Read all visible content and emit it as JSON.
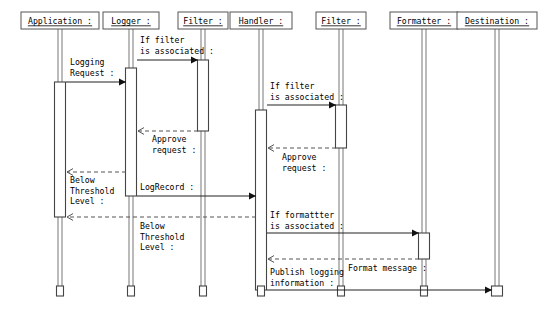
{
  "diagram": {
    "type": "uml-sequence-diagram",
    "width": 550,
    "height": 320,
    "background_color": "#ffffff",
    "line_color": "#555555",
    "text_color": "#000000"
  },
  "participants": [
    {
      "id": "application",
      "label": "Application :",
      "x": 60,
      "box_width": 78,
      "box_height": 17
    },
    {
      "id": "logger",
      "label": "Logger :",
      "x": 131,
      "box_width": 56,
      "box_height": 17
    },
    {
      "id": "filter1",
      "label": "Filter :",
      "x": 203,
      "box_width": 50,
      "box_height": 17
    },
    {
      "id": "handler",
      "label": "Handler :",
      "x": 261,
      "box_width": 62,
      "box_height": 17
    },
    {
      "id": "filter2",
      "label": "Filter :",
      "x": 341,
      "box_width": 50,
      "box_height": 17
    },
    {
      "id": "formatter",
      "label": "Formatter :",
      "x": 424,
      "box_width": 68,
      "box_height": 17
    },
    {
      "id": "destination",
      "label": "Destination :",
      "x": 497,
      "box_width": 80,
      "box_height": 17
    }
  ],
  "activations": [
    {
      "id": "act-application-main",
      "participant": "application",
      "x": 60,
      "top": 82,
      "bottom": 217,
      "width": 11
    },
    {
      "id": "act-logger-main",
      "participant": "logger",
      "x": 131,
      "top": 68,
      "bottom": 196,
      "width": 11
    },
    {
      "id": "act-filter1",
      "participant": "filter1",
      "x": 203,
      "top": 60,
      "bottom": 131,
      "width": 11
    },
    {
      "id": "act-handler-main",
      "participant": "handler",
      "x": 261,
      "top": 110,
      "bottom": 290,
      "width": 11
    },
    {
      "id": "act-filter2",
      "participant": "filter2",
      "x": 341,
      "top": 105,
      "bottom": 148,
      "width": 11
    },
    {
      "id": "act-formatter",
      "participant": "formatter",
      "x": 424,
      "top": 233,
      "bottom": 259,
      "width": 11
    },
    {
      "id": "act-destination-end",
      "participant": "destination",
      "x": 497,
      "top": 286,
      "bottom": 296,
      "width": 11
    }
  ],
  "lifeline_end_stubs": [
    {
      "participant": "application",
      "x": 60,
      "top": 286,
      "bottom": 296,
      "width": 7
    },
    {
      "participant": "logger",
      "x": 131,
      "top": 286,
      "bottom": 296,
      "width": 7
    },
    {
      "participant": "filter1",
      "x": 203,
      "top": 286,
      "bottom": 296,
      "width": 7
    },
    {
      "participant": "handler",
      "x": 261,
      "top": 286,
      "bottom": 296,
      "width": 7
    },
    {
      "participant": "filter2",
      "x": 341,
      "top": 286,
      "bottom": 296,
      "width": 7
    },
    {
      "participant": "formatter",
      "x": 424,
      "top": 286,
      "bottom": 296,
      "width": 7
    }
  ],
  "messages": [
    {
      "id": "msg-logging-request",
      "label": "Logging\nRequest :",
      "label_lines": [
        "Logging",
        "Request :"
      ],
      "from": "application",
      "to": "logger",
      "x1": 66,
      "x2": 126,
      "y": 82,
      "style": "solid",
      "arrow": "filled",
      "direction": "right",
      "label_x": 70,
      "label_y": 62
    },
    {
      "id": "msg-if-filter-associated-1",
      "label": "If filter\nis associated :",
      "label_lines": [
        "If filter",
        "is associated :"
      ],
      "from": "logger",
      "to": "filter1",
      "x1": 137,
      "x2": 198,
      "y": 60,
      "style": "solid",
      "arrow": "filled",
      "direction": "right",
      "label_x": 140,
      "label_y": 40
    },
    {
      "id": "msg-approve-request-1",
      "label": "Approve\nrequest :",
      "label_lines": [
        "Approve",
        "request :"
      ],
      "from": "filter1",
      "to": "logger",
      "x1": 198,
      "x2": 138,
      "y": 131,
      "style": "dashed",
      "arrow": "open",
      "direction": "left",
      "label_x": 152,
      "label_y": 139
    },
    {
      "id": "msg-if-filter-associated-2",
      "label": "If filter\nis associated :",
      "label_lines": [
        "If filter",
        "is associated :"
      ],
      "from": "handler",
      "to": "filter2",
      "x1": 267,
      "x2": 336,
      "y": 105,
      "style": "solid",
      "arrow": "filled",
      "direction": "right",
      "label_x": 270,
      "label_y": 86
    },
    {
      "id": "msg-approve-request-2",
      "label": "Approve\nrequest :",
      "label_lines": [
        "Approve",
        "request :"
      ],
      "from": "filter2",
      "to": "handler",
      "x1": 336,
      "x2": 268,
      "y": 148,
      "style": "dashed",
      "arrow": "open",
      "direction": "left",
      "label_x": 282,
      "label_y": 157
    },
    {
      "id": "msg-below-threshold-1",
      "label": "Below\nThreshold\nLevel :",
      "label_lines": [
        "Below",
        "Threshold",
        "Level :"
      ],
      "from": "logger",
      "to": "application",
      "x1": 126,
      "x2": 67,
      "y": 172,
      "style": "dashed",
      "arrow": "open",
      "direction": "left",
      "label_x": 70,
      "label_y": 180
    },
    {
      "id": "msg-logrecord",
      "label": "LogRecord :",
      "label_lines": [
        "LogRecord :"
      ],
      "from": "logger",
      "to": "handler",
      "x1": 137,
      "x2": 256,
      "y": 196,
      "style": "solid",
      "arrow": "filled",
      "direction": "right",
      "label_x": 140,
      "label_y": 187
    },
    {
      "id": "msg-below-threshold-2",
      "label": "Below\nThreshold\nLevel :",
      "label_lines": [
        "Below",
        "Threshold",
        "Level :"
      ],
      "from": "handler",
      "to": "application",
      "x1": 256,
      "x2": 67,
      "y": 217,
      "style": "dashed",
      "arrow": "open",
      "direction": "left",
      "label_x": 140,
      "label_y": 226
    },
    {
      "id": "msg-if-formatter-associated",
      "label": "If formattter\nis associated :",
      "label_lines": [
        "If formattter",
        "is associated :"
      ],
      "from": "handler",
      "to": "formatter",
      "x1": 267,
      "x2": 419,
      "y": 233,
      "style": "solid",
      "arrow": "filled",
      "direction": "right",
      "label_x": 270,
      "label_y": 215
    },
    {
      "id": "msg-format-message",
      "label": "Format message :",
      "label_lines": [
        "Format message :"
      ],
      "from": "formatter",
      "to": "handler",
      "x1": 419,
      "x2": 268,
      "y": 259,
      "style": "dashed",
      "arrow": "open",
      "direction": "left",
      "label_x": 348,
      "label_y": 268
    },
    {
      "id": "msg-publish-logging-information",
      "label": "Publish logging\ninformation :",
      "label_lines": [
        "Publish logging",
        "information :"
      ],
      "from": "handler",
      "to": "destination",
      "x1": 267,
      "x2": 492,
      "y": 290,
      "style": "solid",
      "arrow": "filled",
      "direction": "right",
      "label_x": 270,
      "label_y": 272
    }
  ]
}
